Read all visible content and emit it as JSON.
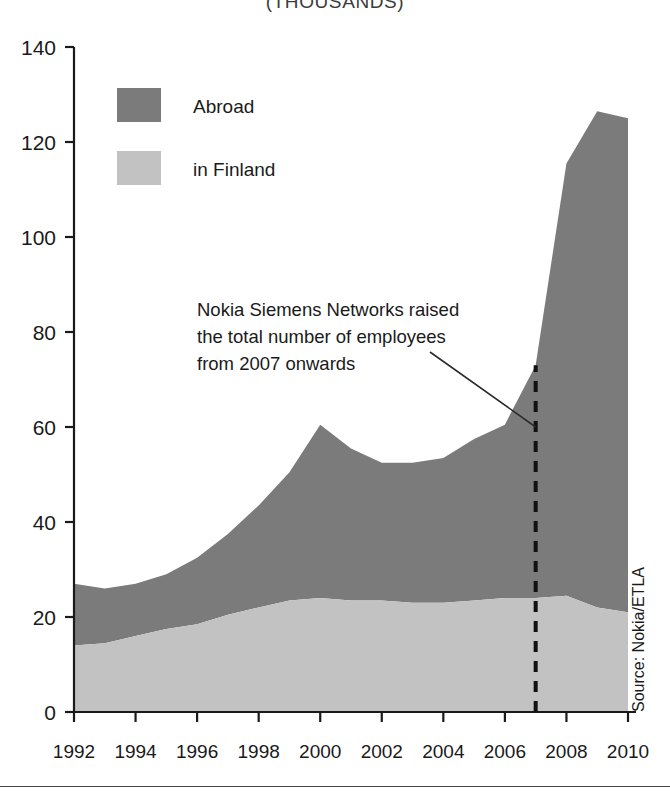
{
  "chart_data": {
    "type": "area",
    "title": "(THOUSANDS)",
    "subtitle": "",
    "xlabel": "",
    "ylabel": "",
    "stacked": true,
    "grid": false,
    "legend_position": "top-left",
    "ylim": [
      0,
      140
    ],
    "xlim": [
      1992,
      2010
    ],
    "y_ticks": [
      0,
      20,
      40,
      60,
      80,
      100,
      120,
      140
    ],
    "x_ticks": [
      1992,
      1994,
      1996,
      1998,
      2000,
      2002,
      2004,
      2006,
      2008,
      2010
    ],
    "x": [
      1992,
      1993,
      1994,
      1995,
      1996,
      1997,
      1998,
      1999,
      2000,
      2001,
      2002,
      2003,
      2004,
      2005,
      2006,
      2007,
      2008,
      2009,
      2010
    ],
    "series": [
      {
        "name": "in Finland",
        "color": "#c2c2c2",
        "values": [
          14,
          14.5,
          16,
          17.5,
          18.5,
          20.5,
          22,
          23.5,
          24,
          23.5,
          23.5,
          23,
          23,
          23.5,
          24,
          24,
          24.5,
          22,
          21
        ]
      },
      {
        "name": "Abroad",
        "color": "#7b7b7b",
        "values": [
          13,
          11.5,
          11,
          11.5,
          14,
          17,
          21.5,
          27,
          36.5,
          32,
          29,
          29.5,
          30.5,
          34,
          36.5,
          49,
          91,
          104.5,
          104
        ]
      }
    ],
    "totals": [
      27,
      26,
      27,
      29,
      32.5,
      37.5,
      43.5,
      50.5,
      60.5,
      55.5,
      52.5,
      52.5,
      53.5,
      57.5,
      60.5,
      73,
      115.5,
      126.5,
      125
    ],
    "annotations": [
      {
        "name": "nokia-siemens-note",
        "lines": [
          "Nokia Siemens Networks raised",
          "the total number of employees",
          "from 2007 onwards"
        ],
        "points_to_year": 2007,
        "points_to_value": 60
      },
      {
        "name": "year-marker-2007",
        "type": "vertical-dashed-line",
        "year": 2007,
        "from_value": 0,
        "to_value": 73
      }
    ],
    "source": "Source: Nokia/ETLA"
  },
  "legend": {
    "items": [
      {
        "label": "Abroad",
        "color": "#7b7b7b"
      },
      {
        "label": "in Finland",
        "color": "#c2c2c2"
      }
    ]
  },
  "axes": {
    "y_tick_labels": [
      "140",
      "120",
      "100",
      "80",
      "60",
      "40",
      "20",
      "0"
    ],
    "x_tick_labels": [
      "1992",
      "1994",
      "1996",
      "1998",
      "2000",
      "2002",
      "2004",
      "2006",
      "2008",
      "2010"
    ]
  },
  "annotation_text": {
    "line1": "Nokia Siemens Networks raised",
    "line2": "the total number of employees",
    "line3": "from 2007 onwards"
  },
  "source": {
    "text": "Source: Nokia/ETLA"
  },
  "title": {
    "text": "(THOUSANDS)"
  }
}
